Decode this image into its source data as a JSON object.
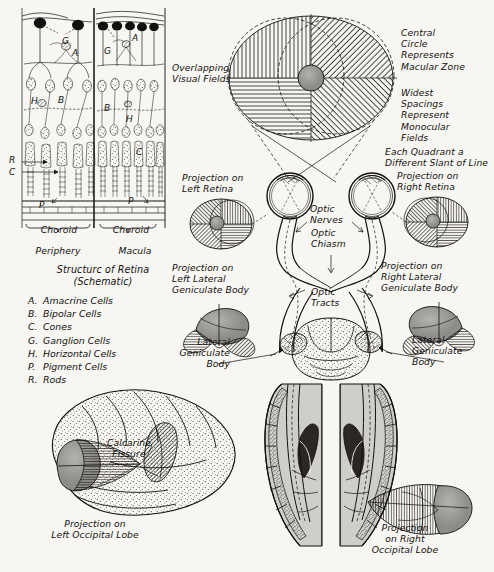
{
  "figure": {
    "title_retina": "Structurc of Retina",
    "title_retina_sub": "(Schematic)"
  },
  "retina_schematic": {
    "choroid_left": "Choroid",
    "choroid_right": "Choroid",
    "periphery": "Periphery",
    "macula": "Macula",
    "markers": {
      "g_left": "G",
      "g_right": "G",
      "a_left": "A",
      "a_right": "A",
      "b_left": "B",
      "b_right": "B",
      "h_left": "H",
      "h_right": "H",
      "c_right": "C",
      "p_left": "P",
      "p_right": "P",
      "r_side": "R",
      "c_side": "C"
    },
    "legend": [
      {
        "key": "A.",
        "label": "Amacrine Cells"
      },
      {
        "key": "B.",
        "label": "Bipolar Cells"
      },
      {
        "key": "C.",
        "label": "Cones"
      },
      {
        "key": "G.",
        "label": "Ganglion Cells"
      },
      {
        "key": "H.",
        "label": "Horizontal Cells"
      },
      {
        "key": "P.",
        "label": "Pigment Cells"
      },
      {
        "key": "R.",
        "label": "Rods"
      }
    ]
  },
  "visual_field": {
    "overlapping": "Overlapping\nVisual Fields",
    "central_circle": "Central\nCircle\nRepresents\nMacular Zone",
    "widest_spacings": "Widest\nSpacings\nRepresent\nMonocular\nFields",
    "each_quadrant": "Each Quadrant a\nDifferent Slant of Line"
  },
  "pathway": {
    "projection_left_retina": "Projection on\nLeft Retina",
    "projection_right_retina": "Projection on\nRight Retina",
    "optic_nerves": "Optic\nNerves",
    "optic_chiasm": "Optic\nChiasm",
    "optic_tracts": "Optic\nTracts",
    "projection_left_lgb": "Projection on\nLeft Lateral\nGeniculate Body",
    "projection_right_lgb": "Projection on\nRight Lateral\nGeniculate Body",
    "lgb_left": "Lateral\nGeniculate\nBody",
    "lgb_right": "Lateral\nGeniculate\nBody"
  },
  "cortex": {
    "calcarine_fissure": "Calcarine\nFissure",
    "projection_left_occipital": "Projection on\nLeft Occipital Lobe",
    "projection_right_occipital": "Projection\non Right\nOccipital Lobe"
  },
  "colors": {
    "ink": "#13110f",
    "paper": "#f7f6f2",
    "macula_gray": "#9a9a96",
    "tissue_gray": "#c9c8c4",
    "brain_gray": "#b9b8b4"
  }
}
